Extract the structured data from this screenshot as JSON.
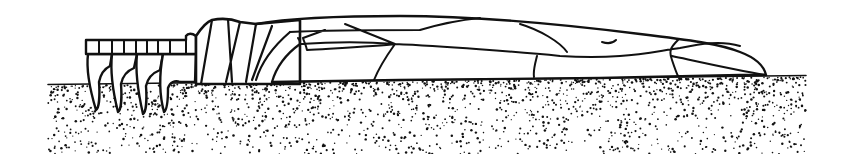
{
  "figure": {
    "background_color": "#ffffff",
    "ink_color": "#111111",
    "ground": {
      "x_start": 48,
      "x_end": 806,
      "surface_y": 84,
      "bottom_y": 154,
      "dot_count": 1900,
      "dense_near_surface": true
    },
    "parts": {
      "head_segments": 9,
      "claws": 4,
      "thorax_plates": 6,
      "wing_cells": 12
    }
  }
}
